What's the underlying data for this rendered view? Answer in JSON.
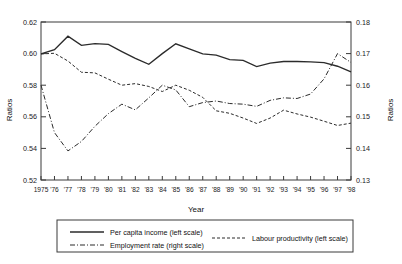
{
  "chart_data": {
    "type": "line",
    "title": "",
    "xlabel": "Year",
    "ylabel": "Ratios",
    "y2label": "Ratios",
    "grid": false,
    "legend_position": "bottom",
    "xlim": [
      1975,
      1998
    ],
    "ylim": [
      0.52,
      0.62
    ],
    "y2lim": [
      0.13,
      0.18
    ],
    "yticks": [
      "0.52",
      "0.54",
      "0.56",
      "0.58",
      "0.60",
      "0.62"
    ],
    "y2ticks": [
      "0.13",
      "0.14",
      "0.15",
      "0.16",
      "0.17",
      "0.18"
    ],
    "x": [
      1975,
      1976,
      1977,
      1978,
      1979,
      1980,
      1981,
      1982,
      1983,
      1984,
      1985,
      1986,
      1987,
      1988,
      1989,
      1990,
      1991,
      1992,
      1993,
      1994,
      1995,
      1996,
      1997,
      1998
    ],
    "xticklabels": [
      "1975",
      "'76",
      "'77",
      "'78",
      "'79",
      "'80",
      "'81",
      "'82",
      "'83",
      "'84",
      "'85",
      "'86",
      "'87",
      "'88",
      "'89",
      "'90",
      "'91",
      "'92",
      "'93",
      "'94",
      "'95",
      "'96",
      "'97",
      "'98"
    ],
    "series": [
      {
        "name": "Per capita income (left scale)",
        "axis": "left",
        "style": "solid",
        "values": [
          0.5998,
          0.6025,
          0.611,
          0.6052,
          0.6063,
          0.6058,
          0.6013,
          0.597,
          0.5932,
          0.6,
          0.6062,
          0.603,
          0.5998,
          0.599,
          0.5962,
          0.5957,
          0.5918,
          0.594,
          0.595,
          0.595,
          0.5948,
          0.5943,
          0.592,
          0.5885
        ]
      },
      {
        "name": "Employment rate (right scale)",
        "axis": "right",
        "style": "dashdot",
        "values": [
          0.16,
          0.145,
          0.1392,
          0.1422,
          0.147,
          0.151,
          0.154,
          0.1522,
          0.156,
          0.16,
          0.1585,
          0.1532,
          0.1545,
          0.155,
          0.1542,
          0.154,
          0.1533,
          0.1552,
          0.156,
          0.1558,
          0.1572,
          0.162,
          0.17,
          0.1672
        ]
      },
      {
        "name": "Labour productivity (left scale)",
        "axis": "left",
        "style": "dashed",
        "values": [
          0.5998,
          0.6002,
          0.5953,
          0.5882,
          0.5878,
          0.5838,
          0.58,
          0.581,
          0.5792,
          0.576,
          0.58,
          0.5768,
          0.5723,
          0.5638,
          0.5622,
          0.5592,
          0.5558,
          0.5592,
          0.5642,
          0.5618,
          0.5598,
          0.5572,
          0.5545,
          0.556
        ]
      }
    ],
    "legend": [
      {
        "label": "Per capita income (left scale)",
        "style": "solid"
      },
      {
        "label": "Employment rate (right scale)",
        "style": "dashdot"
      },
      {
        "label": "Labour productivity (left scale)",
        "style": "dashed"
      }
    ]
  }
}
